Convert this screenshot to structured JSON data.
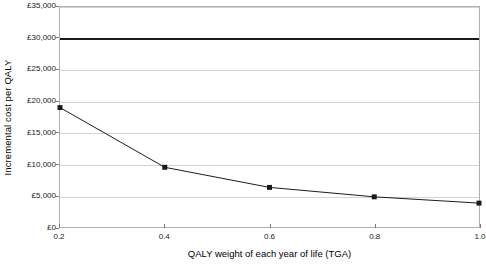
{
  "chart_data": {
    "type": "line",
    "title": "",
    "xlabel": "QALY weight of each year of life (TGA)",
    "ylabel": "Incremental cost per QALY",
    "x": [
      0.2,
      0.4,
      0.6,
      0.8,
      1.0
    ],
    "series": [
      {
        "name": "Incremental cost per QALY",
        "values": [
          19000,
          9500,
          6300,
          4800,
          3800
        ],
        "marker": "square",
        "color": "#1a1a1a"
      }
    ],
    "reference_lines": [
      {
        "name": "cost-effectiveness-threshold",
        "value": 30000,
        "color": "#1a1a1a",
        "width_px": 2
      }
    ],
    "xlim": [
      0.2,
      1.0
    ],
    "ylim": [
      0,
      35000
    ],
    "xticks": [
      0.2,
      0.4,
      0.6,
      0.8,
      1.0
    ],
    "xtick_labels": [
      "0.2",
      "0.4",
      "0.6",
      "0.8",
      "1.0"
    ],
    "yticks": [
      0,
      5000,
      10000,
      15000,
      20000,
      25000,
      30000,
      35000
    ],
    "ytick_labels": [
      "£0",
      "£5,000",
      "£10,000",
      "£15,000",
      "£20,000",
      "£25,000",
      "£30,000",
      "£35,000"
    ],
    "grid": true,
    "grid_axis": "y",
    "grid_color": "#d4d4d4",
    "plot_border_color": "#b0b0b0",
    "background": "#ffffff",
    "legend": null
  }
}
